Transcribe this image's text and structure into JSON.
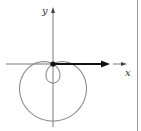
{
  "diagram": {
    "type": "polar-curve",
    "curve": "limaçon with inner loop",
    "axes": {
      "x_label": "x",
      "y_label": "y"
    },
    "vector": {
      "from": "origin",
      "direction": "positive x"
    },
    "colors": {
      "curve": "#8a8a8a",
      "axes": "#555555",
      "vector": "#111111",
      "divider": "#999999"
    }
  }
}
